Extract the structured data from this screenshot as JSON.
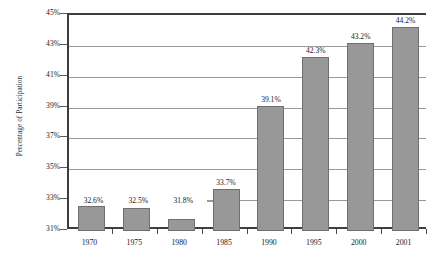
{
  "chart_data": {
    "type": "bar",
    "title": "",
    "subtitle": "",
    "xlabel": "",
    "ylabel": "Percentage of Participation",
    "categories": [
      "1970",
      "1975",
      "1980",
      "1985",
      "1990",
      "1995",
      "2000",
      "2001"
    ],
    "values": [
      32.6,
      32.5,
      31.8,
      33.7,
      39.1,
      42.3,
      43.2,
      44.2
    ],
    "data_labels": [
      "32.6%",
      "32.5%",
      "31.8%",
      "33.7%",
      "39.1%",
      "42.3%",
      "43.2%",
      "44.2%"
    ],
    "series": [
      {
        "name": "Percentage of Participation",
        "values": [
          32.6,
          32.5,
          31.8,
          33.7,
          39.1,
          42.3,
          43.2,
          44.2
        ]
      }
    ],
    "ylim": [
      31,
      45
    ],
    "y_tick_values": [
      31,
      33,
      35,
      37,
      39,
      41,
      43,
      45
    ],
    "y_tick_labels": [
      "31%",
      "33%",
      "35%",
      "37%",
      "39%",
      "41%",
      "43%",
      "45%"
    ],
    "grid": true,
    "grid_axis": "y",
    "legend": false,
    "legend_position": "none",
    "bar_color": "#989898",
    "bar_edge_color": "#6f6f6f",
    "gridline_color": "#9a9a9a",
    "axis_color": "#3d3d3d",
    "text_color": "#1a1a1a",
    "background_color": "#ffffff"
  }
}
